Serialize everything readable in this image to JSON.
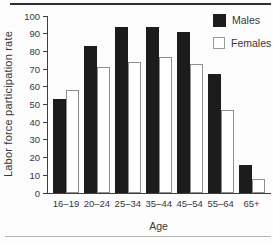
{
  "chart_data": {
    "type": "bar",
    "title": "",
    "xlabel": "Age",
    "ylabel": "Labor force participation rate",
    "categories": [
      "16–19",
      "20–24",
      "25–34",
      "35–44",
      "45–54",
      "55–64",
      "65+"
    ],
    "series": [
      {
        "name": "Males",
        "color": "#1c1c1c",
        "values": [
          53,
          83,
          94,
          94,
          91,
          67,
          16
        ]
      },
      {
        "name": "Females",
        "color": "#ffffff",
        "values": [
          58,
          71,
          74,
          77,
          73,
          47,
          8
        ]
      }
    ],
    "ylim": [
      0,
      100
    ],
    "yticks": [
      0,
      10,
      20,
      30,
      40,
      50,
      60,
      70,
      80,
      90,
      100
    ],
    "grid": false,
    "legend_position": "top-right"
  },
  "colors": {
    "bar_male": "#1c1c1c",
    "bar_female": "#ffffff",
    "bar_border": "#8f8f8f",
    "axis": "#3f3f3f",
    "text": "#383838",
    "top_rule": "#2e2e2e",
    "bottom_rule": "#b4b4b4",
    "background": "#fcfcfc"
  }
}
